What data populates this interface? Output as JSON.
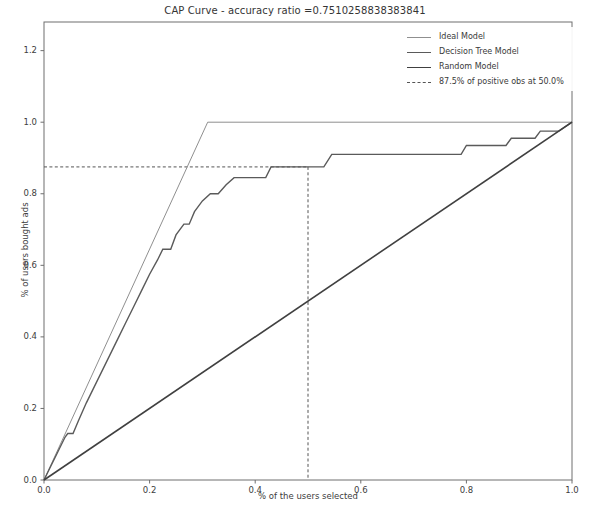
{
  "chart_data": {
    "type": "line",
    "title": "CAP Curve - accuracy ratio =0.7510258838383841",
    "xlabel": "% of the users selected",
    "ylabel": "% of users bought ads",
    "xlim": [
      0.0,
      1.0
    ],
    "ylim": [
      0.0,
      1.28
    ],
    "grid": false,
    "legend_position": "upper right",
    "xticks": [
      "0.0",
      "0.2",
      "0.4",
      "0.6",
      "0.8",
      "1.0"
    ],
    "xtick_values": [
      0.0,
      0.2,
      0.4,
      0.6,
      0.8,
      1.0
    ],
    "yticks": [
      "0.0",
      "0.2",
      "0.4",
      "0.6",
      "0.8",
      "1.0",
      "1.2"
    ],
    "ytick_values": [
      0.0,
      0.2,
      0.4,
      0.6,
      0.8,
      1.0,
      1.2
    ],
    "accuracy_ratio": 0.7510258838383841,
    "annotations": {
      "positive_obs_fraction": 0.875,
      "selected_fraction": 0.5,
      "label": "87.5% of positive obs at 50.0%"
    },
    "series": [
      {
        "name": "Ideal Model",
        "color": "#8f8f8f",
        "style": "solid",
        "width": 1.0,
        "points": [
          [
            0.0,
            0.0
          ],
          [
            0.31,
            1.0
          ],
          [
            1.0,
            1.0
          ]
        ]
      },
      {
        "name": "Decision Tree Model",
        "color": "#5a5a5a",
        "style": "solid",
        "width": 1.4,
        "points": [
          [
            0.0,
            0.0
          ],
          [
            0.04,
            0.12
          ],
          [
            0.045,
            0.13
          ],
          [
            0.055,
            0.13
          ],
          [
            0.065,
            0.165
          ],
          [
            0.08,
            0.215
          ],
          [
            0.1,
            0.275
          ],
          [
            0.12,
            0.335
          ],
          [
            0.14,
            0.395
          ],
          [
            0.155,
            0.44
          ],
          [
            0.17,
            0.485
          ],
          [
            0.185,
            0.53
          ],
          [
            0.2,
            0.575
          ],
          [
            0.215,
            0.615
          ],
          [
            0.225,
            0.645
          ],
          [
            0.24,
            0.645
          ],
          [
            0.25,
            0.685
          ],
          [
            0.265,
            0.715
          ],
          [
            0.275,
            0.715
          ],
          [
            0.285,
            0.75
          ],
          [
            0.3,
            0.78
          ],
          [
            0.315,
            0.8
          ],
          [
            0.33,
            0.8
          ],
          [
            0.345,
            0.825
          ],
          [
            0.36,
            0.845
          ],
          [
            0.4,
            0.845
          ],
          [
            0.42,
            0.845
          ],
          [
            0.43,
            0.875
          ],
          [
            0.5,
            0.875
          ],
          [
            0.53,
            0.875
          ],
          [
            0.545,
            0.91
          ],
          [
            0.79,
            0.91
          ],
          [
            0.8,
            0.935
          ],
          [
            0.875,
            0.935
          ],
          [
            0.885,
            0.955
          ],
          [
            0.93,
            0.955
          ],
          [
            0.94,
            0.975
          ],
          [
            0.975,
            0.975
          ],
          [
            1.0,
            1.0
          ]
        ]
      },
      {
        "name": "Random Model",
        "color": "#404040",
        "style": "solid",
        "width": 1.6,
        "points": [
          [
            0.0,
            0.0
          ],
          [
            1.0,
            1.0
          ]
        ]
      }
    ],
    "legend_entries": [
      {
        "label": "Ideal Model",
        "style": "solid",
        "swatch": "sw-ideal"
      },
      {
        "label": "Decision Tree Model",
        "style": "solid",
        "swatch": "sw-tree"
      },
      {
        "label": "Random Model",
        "style": "solid",
        "swatch": "sw-random"
      },
      {
        "label": "87.5% of positive obs at 50.0%",
        "style": "dashed",
        "swatch": "sw-dashed"
      }
    ]
  }
}
